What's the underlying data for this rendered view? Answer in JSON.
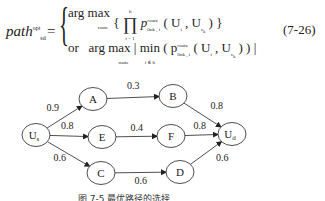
{
  "equation": {
    "lhs": "path",
    "lhs_sup": "opt",
    "lhs_sub": "sd",
    "equals": "=",
    "row1": {
      "argmax": "arg max",
      "under": "route",
      "body": "{ ∏ p",
      "prod_top": "h",
      "prod_bottom": "i = 1",
      "p_sup": "route",
      "p_sub": "link , i",
      "args": "( U",
      "args_i": "i",
      "args_mid": " , U",
      "args_c": "c",
      "args_k": "k",
      "close": " ) }"
    },
    "row2": {
      "or": "or",
      "argmax": "arg max",
      "under": "route",
      "min": "| min",
      "min_under": "i ∈ h",
      "body": "( p",
      "p_sup": "route",
      "p_sub": "link , i",
      "args": "( U",
      "args_i": "i",
      "args_mid": " , U",
      "args_c": "c",
      "args_k": "k",
      "close": " ) ) |"
    },
    "number": "(7-26)"
  },
  "graph": {
    "nodes": [
      {
        "id": "Us",
        "label": "U",
        "sub": "s",
        "x": 36,
        "y": 60
      },
      {
        "id": "A",
        "label": "A",
        "x": 93,
        "y": 24
      },
      {
        "id": "E",
        "label": "E",
        "x": 102,
        "y": 62
      },
      {
        "id": "C",
        "label": "C",
        "x": 101,
        "y": 98
      },
      {
        "id": "B",
        "label": "B",
        "x": 173,
        "y": 21
      },
      {
        "id": "F",
        "label": "F",
        "x": 171,
        "y": 61
      },
      {
        "id": "D",
        "label": "D",
        "x": 180,
        "y": 97
      },
      {
        "id": "Ud",
        "label": "U",
        "sub": "d",
        "x": 232,
        "y": 59
      }
    ],
    "edges": [
      {
        "from": "Us",
        "to": "A",
        "weight": "0.9"
      },
      {
        "from": "Us",
        "to": "E",
        "weight": "0.8"
      },
      {
        "from": "Us",
        "to": "C",
        "weight": "0.6"
      },
      {
        "from": "A",
        "to": "B",
        "weight": "0.3"
      },
      {
        "from": "E",
        "to": "F",
        "weight": "0.4"
      },
      {
        "from": "C",
        "to": "D",
        "weight": "0.6"
      },
      {
        "from": "B",
        "to": "Ud",
        "weight": "0.8"
      },
      {
        "from": "F",
        "to": "Ud",
        "weight": "0.8"
      },
      {
        "from": "D",
        "to": "Ud",
        "weight": "0.6"
      }
    ]
  },
  "caption": "图 7-5   最优路径的选择"
}
